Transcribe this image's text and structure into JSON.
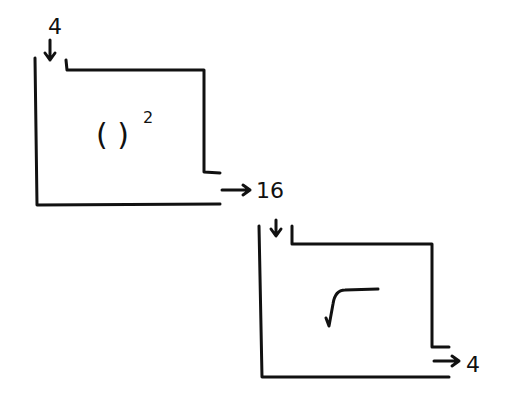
{
  "diagram": {
    "machine1": {
      "operation": "( )",
      "exponent": "2",
      "input": "4",
      "output": "16"
    },
    "machine2": {
      "operation": "√",
      "input": "16",
      "output": "4"
    },
    "colors": {
      "ink": "#111111",
      "background": "#ffffff"
    }
  }
}
